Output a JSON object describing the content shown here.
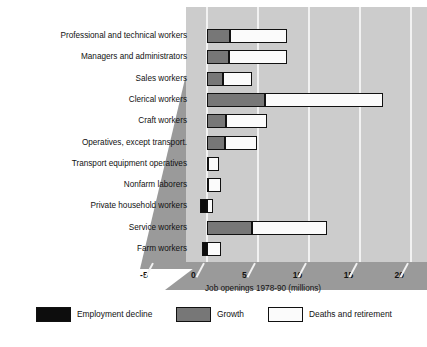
{
  "chart_data": {
    "type": "bar",
    "orientation": "horizontal",
    "stacked": true,
    "title": "",
    "xlabel": "Job openings 1978-90 (millions)",
    "ylabel": "",
    "xlim": [
      -5,
      20
    ],
    "xticks": [
      "-5",
      "0",
      "5",
      "10",
      "15",
      "20"
    ],
    "grid": true,
    "legend_position": "bottom",
    "categories": [
      "Professional and technical workers",
      "Managers and administrators",
      "Sales workers",
      "Clerical workers",
      "Craft workers",
      "Operatives, except transport.",
      "Transport equipment operatives",
      "Nonfarm laborers",
      "Private household workers",
      "Service workers",
      "Farm workers"
    ],
    "series": [
      {
        "name": "Employment decline",
        "color": "#0d0d0d",
        "values": [
          0,
          0,
          0,
          0,
          0,
          0,
          0,
          0,
          -0.7,
          0,
          -0.5
        ]
      },
      {
        "name": "Growth",
        "color": "#777777",
        "values": [
          2.3,
          2.2,
          1.6,
          5.7,
          1.9,
          1.8,
          0.1,
          0.1,
          0,
          4.4,
          0
        ]
      },
      {
        "name": "Deaths and retirement",
        "color": "#fbfbfb",
        "values": [
          5.6,
          5.7,
          2.8,
          11.6,
          4.0,
          3.1,
          1.1,
          1.3,
          0.5,
          7.4,
          1.4
        ]
      }
    ],
    "totals": [
      7.9,
      7.9,
      4.4,
      17.3,
      5.9,
      4.9,
      1.2,
      1.4,
      0.5,
      11.8,
      1.4
    ]
  },
  "axis": {
    "title": "Job openings 1978-90 (millions)",
    "ticks": [
      {
        "label": "-5",
        "value": -5
      },
      {
        "label": "0",
        "value": 0
      },
      {
        "label": "5",
        "value": 5
      },
      {
        "label": "10",
        "value": 10
      },
      {
        "label": "15",
        "value": 15
      },
      {
        "label": "20",
        "value": 20
      }
    ]
  },
  "legend": {
    "items": [
      {
        "label": "Employment decline",
        "swatch": "decline"
      },
      {
        "label": "Growth",
        "swatch": "growth"
      },
      {
        "label": "Deaths and retirement",
        "swatch": "deaths"
      }
    ]
  },
  "header": {
    "cut_title": ""
  }
}
